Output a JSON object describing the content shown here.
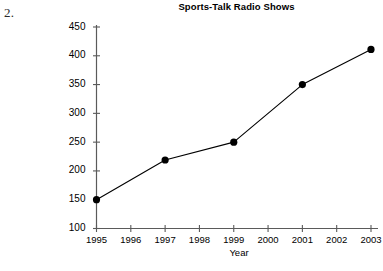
{
  "annotation": {
    "item_number": "2."
  },
  "chart_data": {
    "type": "line",
    "title": "Sports-Talk Radio Shows",
    "xlabel": "Year",
    "ylabel": "",
    "x": [
      1995,
      1997,
      1999,
      2001,
      2003
    ],
    "values": [
      150,
      219,
      250,
      350,
      411
    ],
    "xtick_labels": [
      "1995",
      "1996",
      "1997",
      "1998",
      "1999",
      "2000",
      "2001",
      "2002",
      "2003"
    ],
    "xticks": [
      1995,
      1996,
      1997,
      1998,
      1999,
      2000,
      2001,
      2002,
      2003
    ],
    "ytick_labels": [
      "100",
      "150",
      "200",
      "250",
      "300",
      "350",
      "400",
      "450"
    ],
    "yticks": [
      100,
      150,
      200,
      250,
      300,
      350,
      400,
      450
    ],
    "xlim": [
      1995,
      2003
    ],
    "ylim": [
      100,
      450
    ],
    "grid": false,
    "legend": "none",
    "line_color": "#000000",
    "marker_color": "#000000",
    "marker": "circle",
    "background_color": "#ffffff",
    "axis_color": "#595959",
    "points": [
      {
        "x": 1995,
        "y": 150,
        "label": "1995"
      },
      {
        "x": 1997,
        "y": 219,
        "label": "1997"
      },
      {
        "x": 1999,
        "y": 250,
        "label": "1999"
      },
      {
        "x": 2001,
        "y": 350,
        "label": "2001"
      },
      {
        "x": 2003,
        "y": 411,
        "label": "2003"
      }
    ]
  }
}
